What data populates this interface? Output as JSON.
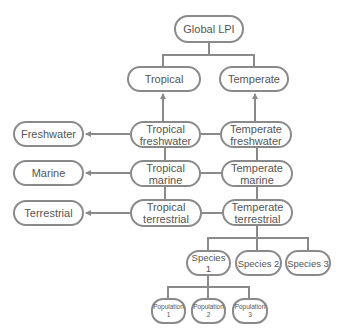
{
  "diagram": {
    "title": "Global LPI",
    "colors": {
      "stroke": "#8a8a8a",
      "text": "#555555",
      "background": "#ffffff"
    },
    "nodes": {
      "global": "Global LPI",
      "tropical": "Tropical",
      "temperate": "Temperate",
      "freshwater": "Freshwater",
      "marine": "Marine",
      "terrestrial": "Terrestrial",
      "tropical_freshwater": "Tropical\nfreshwater",
      "tropical_marine": "Tropical\nmarine",
      "tropical_terrestrial": "Tropical\nterrestrial",
      "temperate_freshwater": "Temperate\nfreshwater",
      "temperate_marine": "Temperate\nmarine",
      "temperate_terrestrial": "Temperate\nterrestrial",
      "species_1": "Species 1",
      "species_2": "Species 2",
      "species_3": "Species 3",
      "population_1": "Population\n1",
      "population_2": "Population\n2",
      "population_3": "Population\n3"
    },
    "edges": [
      {
        "from": "tropical",
        "to": "global",
        "type": "tree"
      },
      {
        "from": "temperate",
        "to": "global",
        "type": "tree"
      },
      {
        "from": "tropical_freshwater",
        "to": "tropical",
        "type": "arrow"
      },
      {
        "from": "temperate_freshwater",
        "to": "temperate",
        "type": "arrow"
      },
      {
        "from": "tropical_freshwater",
        "to": "freshwater",
        "type": "arrow"
      },
      {
        "from": "tropical_marine",
        "to": "marine",
        "type": "arrow"
      },
      {
        "from": "tropical_terrestrial",
        "to": "terrestrial",
        "type": "arrow"
      },
      {
        "from": "tropical_freshwater",
        "to": "temperate_freshwater",
        "type": "line"
      },
      {
        "from": "tropical_marine",
        "to": "temperate_marine",
        "type": "line"
      },
      {
        "from": "tropical_terrestrial",
        "to": "temperate_terrestrial",
        "type": "line"
      },
      {
        "from": "temperate_terrestrial",
        "to": "species_1",
        "type": "tree"
      },
      {
        "from": "temperate_terrestrial",
        "to": "species_2",
        "type": "tree"
      },
      {
        "from": "temperate_terrestrial",
        "to": "species_3",
        "type": "tree"
      },
      {
        "from": "species_1",
        "to": "population_1",
        "type": "tree"
      },
      {
        "from": "species_1",
        "to": "population_2",
        "type": "tree"
      },
      {
        "from": "species_1",
        "to": "population_3",
        "type": "tree"
      }
    ]
  }
}
